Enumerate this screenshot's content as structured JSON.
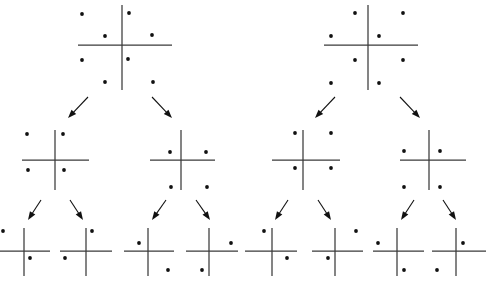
{
  "figure": {
    "title": "",
    "type": "binary-tree-of-quadrant-dot-diagrams",
    "background_color": "#ffffff",
    "axis_color": "#3a3a3a",
    "dot_color": "#111111",
    "arrow_color": "#111111",
    "dot_radius": 1.9,
    "levels": 3,
    "trees": 2
  },
  "chart_data": {
    "type": "scatter",
    "title": "",
    "xlabel": "",
    "ylabel": "",
    "trees": [
      {
        "name": "left-tree",
        "nodes": [
          {
            "id": "L-root",
            "level": 0,
            "cx": 122,
            "cy": 45,
            "hx1": 78,
            "hx2": 172,
            "vy1": 5,
            "vy2": 90,
            "dot_count": 8,
            "dots": [
              {
                "x": 82,
                "y": 14
              },
              {
                "x": 129,
                "y": 13
              },
              {
                "x": 105,
                "y": 36
              },
              {
                "x": 152,
                "y": 35
              },
              {
                "x": 82,
                "y": 60
              },
              {
                "x": 128,
                "y": 59
              },
              {
                "x": 105,
                "y": 82
              },
              {
                "x": 153,
                "y": 82
              }
            ]
          },
          {
            "id": "L-mid-1",
            "level": 1,
            "cx": 55,
            "cy": 160,
            "hx1": 22,
            "hx2": 89,
            "vy1": 130,
            "vy2": 190,
            "dot_count": 4,
            "dots": [
              {
                "x": 27,
                "y": 134
              },
              {
                "x": 63,
                "y": 134
              },
              {
                "x": 28,
                "y": 170
              },
              {
                "x": 64,
                "y": 170
              }
            ]
          },
          {
            "id": "L-mid-2",
            "level": 1,
            "cx": 181,
            "cy": 160,
            "hx1": 150,
            "hx2": 215,
            "vy1": 130,
            "vy2": 190,
            "dot_count": 4,
            "dots": [
              {
                "x": 170,
                "y": 152
              },
              {
                "x": 206,
                "y": 152
              },
              {
                "x": 171,
                "y": 187
              },
              {
                "x": 207,
                "y": 187
              }
            ]
          },
          {
            "id": "L-leaf-1",
            "level": 2,
            "cx": 24,
            "cy": 251,
            "hx1": -4,
            "hx2": 50,
            "vy1": 228,
            "vy2": 276,
            "dot_count": 2,
            "dots": [
              {
                "x": 3,
                "y": 231
              },
              {
                "x": 30,
                "y": 258
              }
            ]
          },
          {
            "id": "L-leaf-2",
            "level": 2,
            "cx": 86,
            "cy": 251,
            "hx1": 60,
            "hx2": 112,
            "vy1": 228,
            "vy2": 276,
            "dot_count": 2,
            "dots": [
              {
                "x": 92,
                "y": 231
              },
              {
                "x": 65,
                "y": 258
              }
            ]
          },
          {
            "id": "L-leaf-3",
            "level": 2,
            "cx": 148,
            "cy": 251,
            "hx1": 124,
            "hx2": 174,
            "vy1": 228,
            "vy2": 276,
            "dot_count": 2,
            "dots": [
              {
                "x": 139,
                "y": 243
              },
              {
                "x": 168,
                "y": 270
              }
            ]
          },
          {
            "id": "L-leaf-4",
            "level": 2,
            "cx": 209,
            "cy": 251,
            "hx1": 186,
            "hx2": 238,
            "vy1": 228,
            "vy2": 276,
            "dot_count": 2,
            "dots": [
              {
                "x": 231,
                "y": 243
              },
              {
                "x": 202,
                "y": 270
              }
            ]
          }
        ],
        "edges": [
          {
            "from": "L-root",
            "to": "L-mid-1",
            "x1": 88,
            "y1": 97,
            "x2": 68,
            "y2": 118
          },
          {
            "from": "L-root",
            "to": "L-mid-2",
            "x1": 152,
            "y1": 97,
            "x2": 172,
            "y2": 118
          },
          {
            "from": "L-mid-1",
            "to": "L-leaf-1",
            "x1": 41,
            "y1": 200,
            "x2": 28,
            "y2": 220
          },
          {
            "from": "L-mid-1",
            "to": "L-leaf-2",
            "x1": 70,
            "y1": 200,
            "x2": 83,
            "y2": 220
          },
          {
            "from": "L-mid-2",
            "to": "L-leaf-3",
            "x1": 166,
            "y1": 200,
            "x2": 152,
            "y2": 220
          },
          {
            "from": "L-mid-2",
            "to": "L-leaf-4",
            "x1": 196,
            "y1": 200,
            "x2": 210,
            "y2": 220
          }
        ]
      },
      {
        "name": "right-tree",
        "nodes": [
          {
            "id": "R-root",
            "level": 0,
            "cx": 368,
            "cy": 45,
            "hx1": 324,
            "hx2": 418,
            "vy1": 5,
            "vy2": 90,
            "dot_count": 8,
            "dots": [
              {
                "x": 355,
                "y": 13
              },
              {
                "x": 403,
                "y": 13
              },
              {
                "x": 331,
                "y": 36
              },
              {
                "x": 379,
                "y": 36
              },
              {
                "x": 355,
                "y": 60
              },
              {
                "x": 403,
                "y": 60
              },
              {
                "x": 331,
                "y": 83
              },
              {
                "x": 379,
                "y": 83
              }
            ]
          },
          {
            "id": "R-mid-1",
            "level": 1,
            "cx": 303,
            "cy": 160,
            "hx1": 272,
            "hx2": 340,
            "vy1": 130,
            "vy2": 190,
            "dot_count": 4,
            "dots": [
              {
                "x": 295,
                "y": 133
              },
              {
                "x": 331,
                "y": 133
              },
              {
                "x": 295,
                "y": 168
              },
              {
                "x": 331,
                "y": 168
              }
            ]
          },
          {
            "id": "R-mid-2",
            "level": 1,
            "cx": 429,
            "cy": 160,
            "hx1": 400,
            "hx2": 466,
            "vy1": 130,
            "vy2": 190,
            "dot_count": 4,
            "dots": [
              {
                "x": 404,
                "y": 151
              },
              {
                "x": 440,
                "y": 151
              },
              {
                "x": 404,
                "y": 187
              },
              {
                "x": 440,
                "y": 187
              }
            ]
          },
          {
            "id": "R-leaf-1",
            "level": 2,
            "cx": 272,
            "cy": 251,
            "hx1": 245,
            "hx2": 297,
            "vy1": 228,
            "vy2": 276,
            "dot_count": 2,
            "dots": [
              {
                "x": 264,
                "y": 231
              },
              {
                "x": 287,
                "y": 258
              }
            ]
          },
          {
            "id": "R-leaf-2",
            "level": 2,
            "cx": 335,
            "cy": 251,
            "hx1": 312,
            "hx2": 363,
            "vy1": 228,
            "vy2": 276,
            "dot_count": 2,
            "dots": [
              {
                "x": 356,
                "y": 231
              },
              {
                "x": 328,
                "y": 258
              }
            ]
          },
          {
            "id": "R-leaf-3",
            "level": 2,
            "cx": 397,
            "cy": 251,
            "hx1": 373,
            "hx2": 424,
            "vy1": 228,
            "vy2": 276,
            "dot_count": 2,
            "dots": [
              {
                "x": 378,
                "y": 243
              },
              {
                "x": 404,
                "y": 270
              }
            ]
          },
          {
            "id": "R-leaf-4",
            "level": 2,
            "cx": 456,
            "cy": 251,
            "hx1": 432,
            "hx2": 486,
            "vy1": 228,
            "vy2": 276,
            "dot_count": 2,
            "dots": [
              {
                "x": 463,
                "y": 243
              },
              {
                "x": 437,
                "y": 270
              }
            ]
          }
        ],
        "edges": [
          {
            "from": "R-root",
            "to": "R-mid-1",
            "x1": 335,
            "y1": 97,
            "x2": 315,
            "y2": 118
          },
          {
            "from": "R-root",
            "to": "R-mid-2",
            "x1": 400,
            "y1": 97,
            "x2": 420,
            "y2": 118
          },
          {
            "from": "R-mid-1",
            "to": "R-leaf-1",
            "x1": 288,
            "y1": 200,
            "x2": 275,
            "y2": 220
          },
          {
            "from": "R-mid-1",
            "to": "R-leaf-2",
            "x1": 318,
            "y1": 200,
            "x2": 331,
            "y2": 220
          },
          {
            "from": "R-mid-2",
            "to": "R-leaf-3",
            "x1": 414,
            "y1": 200,
            "x2": 401,
            "y2": 220
          },
          {
            "from": "R-mid-2",
            "to": "R-leaf-4",
            "x1": 443,
            "y1": 200,
            "x2": 456,
            "y2": 220
          }
        ]
      }
    ]
  }
}
